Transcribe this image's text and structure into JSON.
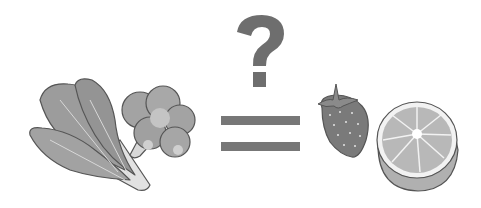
{
  "scene": {
    "description": "Vegetables equal fruits?",
    "left_items": [
      "bok choy",
      "broccoli"
    ],
    "operator": "=",
    "question_mark": "?",
    "right_items": [
      "strawberry",
      "orange half"
    ]
  },
  "colors": {
    "background": "#ffffff",
    "question_mark": "#6e6e6e",
    "equals_bars": "#777777",
    "leaf_fill": "#9a9a9a",
    "leaf_stroke": "#555555",
    "stem_fill": "#e4e4e4",
    "broccoli_fill": "#a3a3a3",
    "strawberry_fill": "#7a7a7a",
    "orange_fill": "#b8b8b8",
    "orange_rind": "#9c9c9c"
  }
}
